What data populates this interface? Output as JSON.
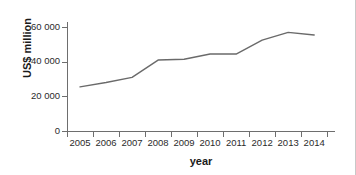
{
  "chart_data": {
    "type": "line",
    "title": "",
    "xlabel": "year",
    "ylabel": "US$ million",
    "categories": [
      "2005",
      "2006",
      "2007",
      "2008",
      "2009",
      "2010",
      "2011",
      "2012",
      "2013",
      "2014"
    ],
    "x": [
      2005,
      2006,
      2007,
      2008,
      2009,
      2010,
      2011,
      2012,
      2013,
      2014
    ],
    "values": [
      25500,
      28000,
      31000,
      41000,
      41500,
      44500,
      44500,
      52500,
      57000,
      55500
    ],
    "series": [
      {
        "name": "US$ million",
        "values": [
          25500,
          28000,
          31000,
          41000,
          41500,
          44500,
          44500,
          52500,
          57000,
          55500
        ]
      }
    ],
    "ylim": [
      0,
      63000
    ],
    "xlim": [
      2004.5,
      2014.8
    ],
    "yticks": [
      0,
      20000,
      40000,
      60000
    ],
    "ytick_labels": [
      "0",
      "20 000",
      "40 000",
      "60 000"
    ],
    "xtick_labels": [
      "2005",
      "2006",
      "2007",
      "2008",
      "2009",
      "2010",
      "2011",
      "2012",
      "2013",
      "2014"
    ],
    "grid": false,
    "legend": false,
    "line_color": "#6a6a6a",
    "axis_color": "#6e6e6e",
    "text_color": "#2b2b2b",
    "background": "#ffffff"
  }
}
